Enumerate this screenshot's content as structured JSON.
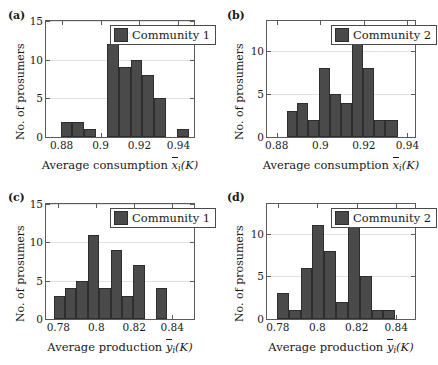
{
  "figure": {
    "bar_color": "#4a4a4a",
    "bar_edge_color": "#2e2e2e",
    "axis_color": "#5a5a5a",
    "grid_color": "#e2e2e2",
    "background": "#ffffff"
  },
  "chart_data": [
    {
      "id": "a",
      "panel_label": "(a)",
      "type": "bar",
      "title": "",
      "legend": {
        "label": "Community 1",
        "position": "top-right"
      },
      "xlabel_text": "Average consumption",
      "xlabel_symbol": "x",
      "xlabel_symbol_sub": "i",
      "xlabel_arg": "(K)",
      "ylabel": "No. of prosumers",
      "xlim": [
        0.872,
        0.948
      ],
      "ylim": [
        0,
        15
      ],
      "xticks": [
        0.88,
        0.9,
        0.92,
        0.94
      ],
      "xticklabels": [
        "0.88",
        "0.9",
        "0.92",
        "0.94"
      ],
      "yticks": [
        0,
        5,
        10,
        15
      ],
      "yticklabels": [
        "0",
        "5",
        "10",
        "15"
      ],
      "grid": true,
      "bin_edges": [
        0.8795,
        0.8855,
        0.8915,
        0.8975,
        0.9035,
        0.9095,
        0.9155,
        0.9215,
        0.9275,
        0.9335,
        0.9395,
        0.9455
      ],
      "values": [
        2,
        2,
        1,
        0,
        12,
        9,
        10,
        8,
        5,
        0,
        1
      ]
    },
    {
      "id": "b",
      "panel_label": "(b)",
      "type": "bar",
      "title": "",
      "legend": {
        "label": "Community 2",
        "position": "top-right"
      },
      "xlabel_text": "Average consumption",
      "xlabel_symbol": "x",
      "xlabel_symbol_sub": "i",
      "xlabel_arg": "(K)",
      "ylabel": "No. of prosumers",
      "xlim": [
        0.8755,
        0.9435
      ],
      "ylim": [
        0,
        13.5
      ],
      "xticks": [
        0.88,
        0.9,
        0.92,
        0.94
      ],
      "xticklabels": [
        "0.88",
        "0.9",
        "0.92",
        "0.94"
      ],
      "yticks": [
        0,
        5,
        10
      ],
      "yticklabels": [
        "0",
        "5",
        "10"
      ],
      "grid": true,
      "bin_edges": [
        0.8845,
        0.8895,
        0.8945,
        0.8995,
        0.9045,
        0.9095,
        0.9145,
        0.9195,
        0.9245,
        0.9295,
        0.9355
      ],
      "values": [
        3,
        4,
        2,
        8,
        5,
        4,
        11,
        8,
        2,
        2
      ]
    },
    {
      "id": "c",
      "panel_label": "(c)",
      "type": "bar",
      "title": "",
      "legend": {
        "label": "Community 1",
        "position": "top-right"
      },
      "xlabel_text": "Average production",
      "xlabel_symbol": "y",
      "xlabel_symbol_sub": "i",
      "xlabel_arg": "(K)",
      "ylabel": "No. of prosumers",
      "xlim": [
        0.7735,
        0.8515
      ],
      "ylim": [
        0,
        15
      ],
      "xticks": [
        0.78,
        0.8,
        0.82,
        0.84
      ],
      "xticklabels": [
        "0.78",
        "0.8",
        "0.82",
        "0.84"
      ],
      "yticks": [
        0,
        5,
        10,
        15
      ],
      "yticklabels": [
        "0",
        "5",
        "10",
        "15"
      ],
      "grid": true,
      "bin_edges": [
        0.7775,
        0.7835,
        0.7895,
        0.7955,
        0.8015,
        0.8075,
        0.8135,
        0.8195,
        0.8255,
        0.8315,
        0.8375,
        0.8435,
        0.8495
      ],
      "values": [
        3,
        4,
        5,
        11,
        4,
        9,
        3,
        7,
        0,
        4
      ]
    },
    {
      "id": "d",
      "panel_label": "(d)",
      "type": "bar",
      "title": "",
      "legend": {
        "label": "Community 2",
        "position": "top-right"
      },
      "xlabel_text": "Average production",
      "xlabel_symbol": "y",
      "xlabel_symbol_sub": "i",
      "xlabel_arg": "(K)",
      "ylabel": "No. of prosumers",
      "xlim": [
        0.7745,
        0.8495
      ],
      "ylim": [
        0,
        13.5
      ],
      "xticks": [
        0.78,
        0.8,
        0.82,
        0.84
      ],
      "xticklabels": [
        "0.78",
        "0.8",
        "0.82",
        "0.84"
      ],
      "yticks": [
        0,
        5,
        10
      ],
      "yticklabels": [
        "0",
        "5",
        "10"
      ],
      "grid": true,
      "bin_edges": [
        0.7795,
        0.7855,
        0.7915,
        0.7975,
        0.8035,
        0.8095,
        0.8155,
        0.8215,
        0.8275,
        0.8335,
        0.8395,
        0.8455
      ],
      "values": [
        3,
        1,
        6,
        11,
        8,
        2,
        11,
        5,
        1,
        1
      ]
    }
  ]
}
